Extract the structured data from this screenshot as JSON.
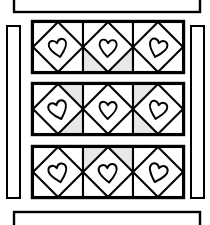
{
  "figure": {
    "background_color": "#ffffff",
    "line_color": "#000000",
    "shade_color": "#e8e8e8",
    "width": 210,
    "height": 225
  },
  "sashing": {
    "top": {
      "name": "top-sashing-strip",
      "x": 14,
      "y": -14,
      "width": 186,
      "height": 26,
      "fill": "#ffffff",
      "stroke": "#000000",
      "stroke_width": 2.4,
      "clipped": "top"
    },
    "bottom": {
      "name": "bottom-sashing-strip",
      "x": 14,
      "y": 212,
      "width": 186,
      "height": 26,
      "fill": "#ffffff",
      "stroke": "#000000",
      "stroke_width": 2.4,
      "clipped": "bottom"
    },
    "left": {
      "name": "left-sashing-strip",
      "x": 7,
      "y": 26,
      "width": 13,
      "height": 172,
      "fill": "#ffffff",
      "stroke": "#000000",
      "stroke_width": 2.0
    },
    "right": {
      "name": "right-sashing-strip",
      "x": 191,
      "y": 26,
      "width": 13,
      "height": 172,
      "fill": "#ffffff",
      "stroke": "#000000",
      "stroke_width": 2.0
    }
  },
  "grid": {
    "rows": 3,
    "columns": 3,
    "origin_x": 33,
    "origin_y": 22,
    "cell_width": 50,
    "cell_height": 50,
    "row_gap": 12,
    "row_tops": [
      22,
      84,
      147
    ],
    "column_lefts": [
      33,
      83,
      133
    ],
    "blocks": [
      {
        "id": "r1c1",
        "name": "heart-block-r1c1",
        "row": 1,
        "column": 1,
        "motif": "heart",
        "heart_rotation": -12,
        "heart_scale": 0.92,
        "shaded_corners": []
      },
      {
        "id": "r1c2",
        "name": "heart-block-r1c2",
        "row": 1,
        "column": 2,
        "motif": "heart",
        "heart_rotation": 4,
        "heart_scale": 0.9,
        "shaded_corners": [
          "bottom-left",
          "bottom-right"
        ]
      },
      {
        "id": "r1c3",
        "name": "heart-block-r1c3",
        "row": 1,
        "column": 3,
        "motif": "heart",
        "heart_rotation": 16,
        "heart_scale": 0.93,
        "shaded_corners": []
      },
      {
        "id": "r2c1",
        "name": "heart-block-r2c1",
        "row": 2,
        "column": 1,
        "motif": "heart",
        "heart_rotation": -18,
        "heart_scale": 0.95,
        "shaded_corners": [
          "top-right",
          "bottom-right"
        ]
      },
      {
        "id": "r2c2",
        "name": "heart-block-r2c2",
        "row": 2,
        "column": 2,
        "motif": "heart",
        "heart_rotation": 2,
        "heart_scale": 0.9,
        "shaded_corners": []
      },
      {
        "id": "r2c3",
        "name": "heart-block-r2c3",
        "row": 2,
        "column": 3,
        "motif": "heart",
        "heart_rotation": 14,
        "heart_scale": 0.92,
        "shaded_corners": [
          "top-left",
          "bottom-left"
        ]
      },
      {
        "id": "r3c1",
        "name": "heart-block-r3c1",
        "row": 3,
        "column": 1,
        "motif": "heart",
        "heart_rotation": -14,
        "heart_scale": 0.95,
        "shaded_corners": []
      },
      {
        "id": "r3c2",
        "name": "heart-block-r3c2",
        "row": 3,
        "column": 2,
        "motif": "heart",
        "heart_rotation": -6,
        "heart_scale": 0.95,
        "shaded_corners": [
          "top-left",
          "top-right"
        ]
      },
      {
        "id": "r3c3",
        "name": "heart-block-r3c3",
        "row": 3,
        "column": 3,
        "motif": "heart",
        "heart_rotation": 18,
        "heart_scale": 0.95,
        "shaded_corners": []
      }
    ]
  }
}
